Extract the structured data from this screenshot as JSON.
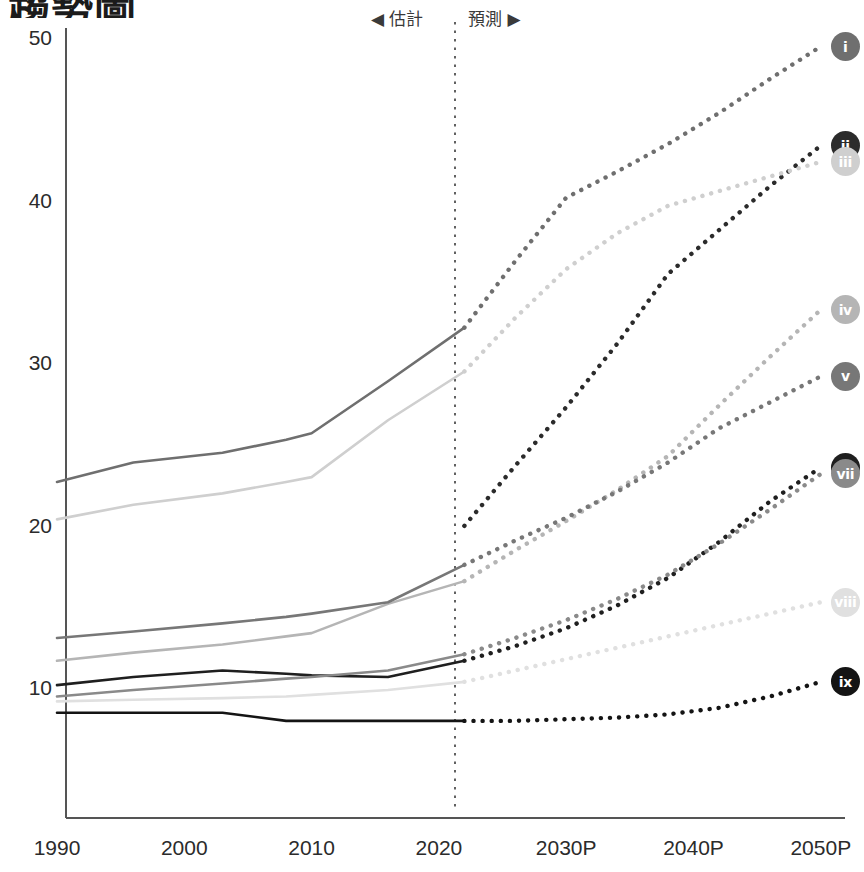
{
  "title": {
    "text": "趨勢圖",
    "clipped": true
  },
  "annotations": {
    "estimate": "◀ 估計",
    "forecast": "預測 ▶",
    "divider_year": 2022
  },
  "chart_data": {
    "type": "line",
    "title": "趨勢圖",
    "xlabel": "",
    "ylabel": "",
    "xlim": [
      1990,
      2050
    ],
    "ylim": [
      5,
      52
    ],
    "grid": false,
    "legend": "endpoint-badges",
    "x_ticks": [
      "1990",
      "2000",
      "2010",
      "2020",
      "2030P",
      "2040P",
      "2050P"
    ],
    "x_tick_values": [
      1990,
      2000,
      2010,
      2020,
      2030,
      2040,
      2050
    ],
    "y_ticks": [
      "10",
      "20",
      "30",
      "40",
      "50"
    ],
    "y_tick_values": [
      10,
      20,
      30,
      40,
      50
    ],
    "history_x": [
      1990,
      1996,
      2003,
      2008,
      2010,
      2016,
      2022
    ],
    "forecast_x": [
      2022,
      2026,
      2030,
      2034,
      2038,
      2042,
      2046,
      2050
    ],
    "series": [
      {
        "name": "i",
        "badge": "i",
        "color": "#6f6f6f",
        "history": [
          22.8,
          24.0,
          24.6,
          25.4,
          25.8,
          29.0,
          32.3
        ],
        "forecast": [
          32.3,
          36.4,
          40.3,
          41.9,
          43.6,
          45.5,
          47.6,
          49.6
        ]
      },
      {
        "name": "ii",
        "badge": "ii",
        "color": "#2b2b2b",
        "history": [
          null,
          null,
          null,
          null,
          null,
          null,
          20.1
        ],
        "forecast": [
          20.1,
          23.8,
          27.4,
          31.3,
          35.6,
          38.3,
          41.0,
          43.5
        ]
      },
      {
        "name": "iii",
        "badge": "iii",
        "color": "#cfcfcf",
        "history": [
          20.5,
          21.4,
          22.1,
          22.8,
          23.1,
          26.6,
          29.6
        ],
        "forecast": [
          29.6,
          32.9,
          35.9,
          38.1,
          39.8,
          40.7,
          41.6,
          42.5
        ]
      },
      {
        "name": "iv",
        "badge": "iv",
        "color": "#b5b5b5",
        "history": [
          11.8,
          12.3,
          12.8,
          13.3,
          13.5,
          15.3,
          16.7
        ],
        "forecast": [
          16.7,
          18.6,
          20.4,
          22.3,
          24.4,
          27.5,
          30.5,
          33.4
        ]
      },
      {
        "name": "v",
        "badge": "v",
        "color": "#777777",
        "history": [
          13.2,
          13.6,
          14.1,
          14.5,
          14.7,
          15.4,
          17.7
        ],
        "forecast": [
          17.7,
          19.2,
          20.6,
          22.2,
          24.0,
          26.1,
          27.7,
          29.3
        ]
      },
      {
        "name": "vi",
        "badge": "vi",
        "color": "#1f1f1f",
        "history": [
          10.3,
          10.8,
          11.2,
          11.0,
          10.9,
          10.8,
          11.8
        ],
        "forecast": [
          11.8,
          12.7,
          13.8,
          15.2,
          16.9,
          19.1,
          21.6,
          23.7
        ]
      },
      {
        "name": "vii",
        "badge": "vii",
        "color": "#8a8a8a",
        "history": [
          9.6,
          10.0,
          10.4,
          10.7,
          10.8,
          11.2,
          12.2
        ],
        "forecast": [
          12.2,
          13.2,
          14.3,
          15.6,
          17.1,
          19.0,
          21.1,
          23.3
        ]
      },
      {
        "name": "viii",
        "badge": "viii",
        "color": "#e0e0e0",
        "history": [
          9.3,
          9.4,
          9.5,
          9.6,
          9.7,
          10.0,
          10.5
        ],
        "forecast": [
          10.5,
          11.2,
          11.9,
          12.6,
          13.3,
          14.0,
          14.7,
          15.4
        ]
      },
      {
        "name": "ix",
        "badge": "ix",
        "color": "#141414",
        "history": [
          8.6,
          8.6,
          8.6,
          8.1,
          8.1,
          8.1,
          8.1
        ],
        "forecast": [
          8.1,
          8.1,
          8.2,
          8.3,
          8.5,
          8.9,
          9.6,
          10.5
        ]
      }
    ]
  },
  "axes": {
    "axis_color": "#555555",
    "divider_color": "#3a3a3a"
  }
}
